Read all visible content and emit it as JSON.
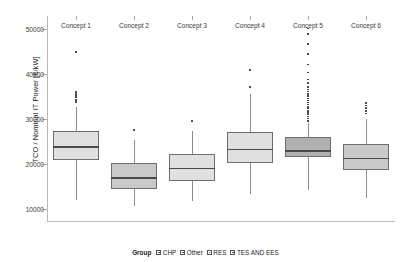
{
  "chart_data": {
    "type": "box",
    "title": "",
    "xlabel": "",
    "ylabel": "TCO / Nominal IT Power [€/kW]",
    "ylim": [
      7000,
      53000
    ],
    "yticks": [
      10000,
      20000,
      30000,
      40000,
      50000
    ],
    "ytick_labels": [
      "10000",
      "20000",
      "30000",
      "40000",
      "50000"
    ],
    "grid": false,
    "legend_position": "bottom",
    "categories": [
      "Concept 1",
      "Concept 2",
      "Concept 3",
      "Concept 4",
      "Concept 5",
      "Concept 6"
    ],
    "boxes": [
      {
        "category": "Concept 1",
        "whisker_low": 12000,
        "q1": 20800,
        "median": 23900,
        "q3": 27400,
        "whisker_high": 32600,
        "fill": "#e0e0e0",
        "outliers": [
          33800,
          34300,
          34800,
          35200,
          35600,
          36000,
          45000
        ]
      },
      {
        "category": "Concept 2",
        "whisker_low": 10600,
        "q1": 14400,
        "median": 17000,
        "q3": 20200,
        "whisker_high": 25200,
        "fill": "#c9c9c9",
        "outliers": [
          27500
        ]
      },
      {
        "category": "Concept 3",
        "whisker_low": 11600,
        "q1": 16200,
        "median": 19100,
        "q3": 22100,
        "whisker_high": 27300,
        "fill": "#e0e0e0",
        "outliers": [
          29600
        ]
      },
      {
        "category": "Concept 4",
        "whisker_low": 13200,
        "q1": 20200,
        "median": 23400,
        "q3": 27000,
        "whisker_high": 35600,
        "fill": "#e0e0e0",
        "outliers": [
          37100,
          40900
        ]
      },
      {
        "category": "Concept 5",
        "whisker_low": 14200,
        "q1": 21500,
        "median": 23000,
        "q3": 26000,
        "whisker_high": 29000,
        "fill": "#b0b0b0",
        "outliers": [
          29600,
          30100,
          30600,
          31100,
          31500,
          31900,
          32300,
          32700,
          33200,
          33700,
          34100,
          34600,
          35100,
          35600,
          36100,
          36600,
          37200,
          38000,
          38800,
          40400,
          42200,
          44500,
          46800,
          49000,
          50200
        ]
      },
      {
        "category": "Concept 6",
        "whisker_low": 12400,
        "q1": 18700,
        "median": 21300,
        "q3": 24400,
        "whisker_high": 30000,
        "fill": "#c9c9c9",
        "outliers": [
          31200,
          31800,
          32400,
          33000,
          33600
        ]
      }
    ]
  },
  "legend": {
    "title": "Group",
    "entries": [
      {
        "label": "CHP"
      },
      {
        "label": "Other"
      },
      {
        "label": "RES"
      },
      {
        "label": "TES AND EES"
      }
    ]
  }
}
